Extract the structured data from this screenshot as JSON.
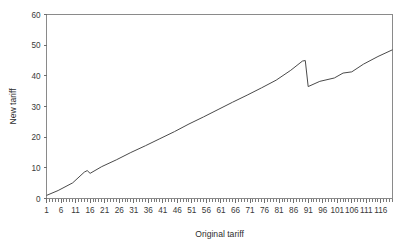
{
  "chart_data": {
    "type": "line",
    "title": "",
    "subtitle": "",
    "xlabel": "Original tariff",
    "ylabel": "New tariff",
    "xlim": [
      1,
      120
    ],
    "ylim": [
      0,
      60
    ],
    "grid": false,
    "legend": null,
    "legend_position": "none",
    "y_ticks": [
      0,
      10,
      20,
      30,
      40,
      50,
      60
    ],
    "y_tick_labels": [
      "0",
      "10",
      "20",
      "30",
      "40",
      "50",
      "60"
    ],
    "x_ticks": [
      1,
      6,
      11,
      16,
      21,
      26,
      31,
      36,
      41,
      46,
      51,
      56,
      61,
      66,
      71,
      76,
      81,
      86,
      91,
      96,
      101,
      106,
      111,
      116
    ],
    "x_tick_labels": [
      "1",
      "6",
      "11",
      "16",
      "21",
      "26",
      "31",
      "36",
      "41",
      "46",
      "51",
      "56",
      "61",
      "66",
      "71",
      "76",
      "81",
      "86",
      "91",
      "96",
      "101",
      "106",
      "111",
      "116"
    ],
    "x_minor_tick_step": 1,
    "series": [
      {
        "name": "New tariff",
        "color": "#4a4a4a",
        "x": [
          1,
          5,
          10,
          14,
          15,
          16,
          20,
          25,
          30,
          35,
          40,
          45,
          50,
          55,
          60,
          65,
          70,
          75,
          80,
          85,
          89,
          90,
          91,
          95,
          100,
          103,
          106,
          110,
          115,
          120
        ],
        "values": [
          1.0,
          2.6,
          5.1,
          8.6,
          9.1,
          8.2,
          10.4,
          12.6,
          15.0,
          17.2,
          19.5,
          21.8,
          24.3,
          26.6,
          29.0,
          31.4,
          33.7,
          36.1,
          38.6,
          41.8,
          44.8,
          45.0,
          36.5,
          38.2,
          39.3,
          40.9,
          41.3,
          43.8,
          46.3,
          48.5
        ]
      }
    ],
    "annotations": [
      {
        "label": "minor downward step",
        "x": 15,
        "y_from": 9.1,
        "y_to": 8.2
      },
      {
        "label": "sharp downward jump",
        "x": 90,
        "y_from": 45.0,
        "y_to": 36.5
      }
    ]
  },
  "axes": {
    "frame_color": "#8a8a8a",
    "background": "#ffffff"
  }
}
